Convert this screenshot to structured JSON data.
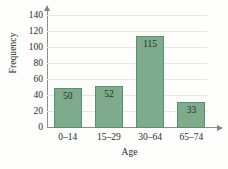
{
  "chart_data": {
    "type": "bar",
    "title": "",
    "xlabel": "Age",
    "ylabel": "Frequency",
    "categories": [
      "0–14",
      "15–29",
      "30–64",
      "65–74"
    ],
    "values": [
      50,
      52,
      115,
      33
    ],
    "value_labels": [
      "50",
      "52",
      "115",
      "33"
    ],
    "ylim": [
      0,
      140
    ],
    "ytick_values": [
      0,
      20,
      40,
      60,
      80,
      100,
      120,
      140
    ],
    "ytick_labels": [
      "0",
      "20",
      "40",
      "60",
      "80",
      "100",
      "120",
      "140"
    ],
    "grid": "horizontal",
    "legend": "none",
    "colors": {
      "bar_fill": "#7dab8c",
      "bar_border": "#5c8e72",
      "gridline": "#e2e6e4",
      "axis": "#8b8f92",
      "text": "#2b2b2b",
      "value_text": "#23312a",
      "background": "#fdfdfc"
    }
  }
}
